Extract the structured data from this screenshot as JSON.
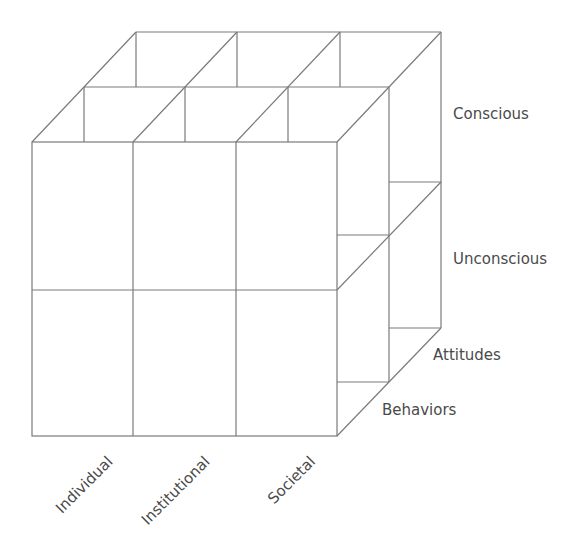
{
  "diagram": {
    "type": "3x2x2 cube matrix",
    "line_color": "#7a7a7a",
    "text_color": "#4a4a4a",
    "x_axis": {
      "labels": [
        "Individual",
        "Institutional",
        "Societal"
      ]
    },
    "y_axis": {
      "labels": [
        "Conscious",
        "Unconscious"
      ]
    },
    "z_axis": {
      "labels": [
        "Attitudes",
        "Behaviors"
      ]
    }
  }
}
